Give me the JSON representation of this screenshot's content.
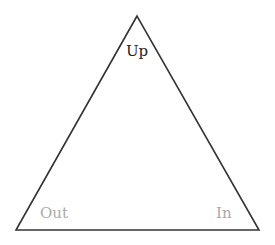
{
  "diagram": {
    "shape": "triangle",
    "labels": {
      "top": "Up",
      "bottom_left": "Out",
      "bottom_right": "In"
    },
    "colors": {
      "stroke": "#333333",
      "top_label": "#222222",
      "corner_labels": "#aaaaaa"
    }
  }
}
